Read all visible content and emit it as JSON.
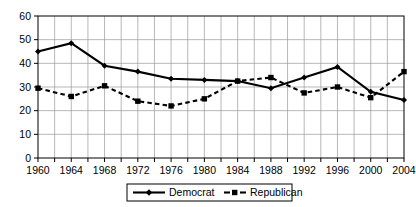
{
  "chart_data": {
    "type": "line",
    "title": "",
    "xlabel": "",
    "ylabel": "",
    "x": [
      1960,
      1964,
      1968,
      1972,
      1976,
      1980,
      1984,
      1988,
      1992,
      1996,
      2000,
      2004
    ],
    "categories": [
      "1960",
      "1964",
      "1968",
      "1972",
      "1976",
      "1980",
      "1984",
      "1988",
      "1992",
      "1996",
      "2000",
      "2004"
    ],
    "series": [
      {
        "name": "Democrat",
        "marker": "diamond",
        "linestyle": "solid",
        "color": "#000000",
        "values": [
          45,
          48.5,
          39,
          36.5,
          33.5,
          33,
          32.5,
          29.5,
          34,
          38.5,
          28,
          24.5
        ]
      },
      {
        "name": "Republican",
        "marker": "square",
        "linestyle": "dashed",
        "color": "#000000",
        "values": [
          29.5,
          26,
          30.5,
          24,
          22,
          25,
          32.5,
          34,
          27.5,
          30,
          25.5,
          36.5
        ]
      }
    ],
    "ylim": [
      0,
      60
    ],
    "xlim": [
      1960,
      2004
    ],
    "yticks": [
      0,
      10,
      20,
      30,
      40,
      50,
      60
    ],
    "ytick_labels": [
      "0",
      "10",
      "20",
      "30",
      "40",
      "50",
      "60"
    ],
    "xtick_labels": [
      "1960",
      "1964",
      "1968",
      "1972",
      "1976",
      "1980",
      "1984",
      "1988",
      "1992",
      "1996",
      "2000",
      "2004"
    ],
    "minor_xticks_every": 2,
    "grid": true,
    "grid_axis": "both",
    "legend_position": "bottom-center",
    "legend_entries": [
      "Democrat",
      "Republican"
    ]
  },
  "legend": {
    "democrat_label": "Democrat",
    "republican_label": "Republican"
  },
  "axis": {
    "y_labels": [
      "60",
      "50",
      "40",
      "30",
      "20",
      "10",
      "0"
    ],
    "x_labels": [
      "1960",
      "1964",
      "1968",
      "1972",
      "1976",
      "1980",
      "1984",
      "1988",
      "1992",
      "1996",
      "2000",
      "2004"
    ]
  }
}
